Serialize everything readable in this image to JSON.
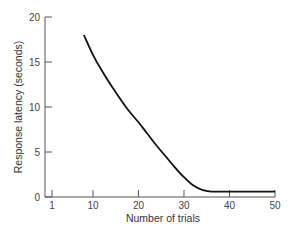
{
  "chart_data": {
    "type": "line",
    "title": "",
    "xlabel": "Number of trials",
    "ylabel": "Response latency (seconds)",
    "xlim": [
      1,
      50
    ],
    "ylim": [
      0,
      20
    ],
    "x_ticks": [
      1,
      10,
      20,
      30,
      40,
      50
    ],
    "y_ticks": [
      0,
      5,
      10,
      15,
      20
    ],
    "grid": false,
    "legend": null,
    "series": [
      {
        "name": "Response latency",
        "x": [
          8,
          10,
          12,
          14,
          16,
          18,
          20,
          22,
          24,
          26,
          28,
          30,
          32,
          34,
          36,
          38,
          40,
          45,
          50
        ],
        "y": [
          18.0,
          15.8,
          14.0,
          12.4,
          10.9,
          9.5,
          8.3,
          7.0,
          5.7,
          4.5,
          3.3,
          2.2,
          1.3,
          0.8,
          0.6,
          0.6,
          0.6,
          0.6,
          0.6
        ]
      }
    ],
    "color": "#111111"
  }
}
